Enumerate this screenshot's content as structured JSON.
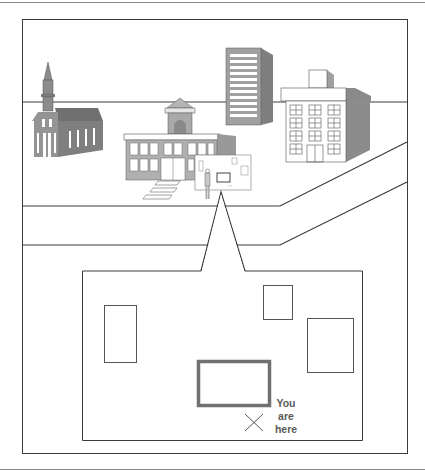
{
  "figure": {
    "scene": {
      "buildings": [
        {
          "name": "church",
          "fill": "#8c8c8c"
        },
        {
          "name": "school",
          "fill": "#a9a9a9"
        },
        {
          "name": "tower-block",
          "fill": "#9a9a9a"
        },
        {
          "name": "office-building",
          "fill": "#ffffff"
        }
      ],
      "map_sign": {
        "name": "directory-map-sign"
      },
      "person": {
        "name": "person-reading-sign"
      }
    },
    "inset_map": {
      "footprints": [
        {
          "name": "footprint-left",
          "highlighted": false
        },
        {
          "name": "footprint-top-right-small",
          "highlighted": false
        },
        {
          "name": "footprint-right",
          "highlighted": false
        },
        {
          "name": "footprint-center",
          "highlighted": true
        }
      ],
      "marker": {
        "symbol": "×",
        "name": "you-are-here-marker"
      },
      "marker_label": {
        "line1": "You",
        "line2": "are",
        "line3": "here"
      }
    },
    "colors": {
      "line": "#3a3a3a",
      "highlight_border": "#707070",
      "label_text": "#5a5a5a"
    }
  }
}
